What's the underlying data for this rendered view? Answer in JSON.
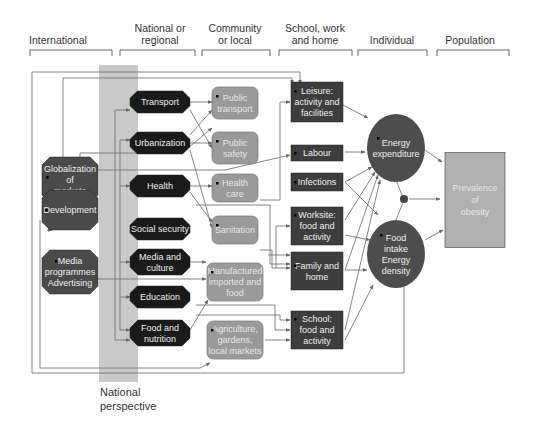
{
  "headers": [
    {
      "lines": [
        "International"
      ],
      "x": 58
    },
    {
      "lines": [
        "National or",
        "regional"
      ],
      "x": 160
    },
    {
      "lines": [
        "Community",
        "or local"
      ],
      "x": 235
    },
    {
      "lines": [
        "School, work",
        "and home"
      ],
      "x": 315
    },
    {
      "lines": [
        "Individual"
      ],
      "x": 392
    },
    {
      "lines": [
        "Population"
      ],
      "x": 470
    }
  ],
  "international": [
    {
      "id": "globalization",
      "lines": [
        "Globalization",
        "of",
        "markets"
      ]
    },
    {
      "id": "development",
      "lines": [
        "Development"
      ]
    },
    {
      "id": "media-advertising",
      "lines": [
        "Media",
        "programmes",
        "Advertising"
      ]
    }
  ],
  "national": [
    {
      "id": "transport",
      "lines": [
        "Transport"
      ]
    },
    {
      "id": "urbanization",
      "lines": [
        "Urbanization"
      ]
    },
    {
      "id": "health",
      "lines": [
        "Health"
      ]
    },
    {
      "id": "social-security",
      "lines": [
        "Social security"
      ]
    },
    {
      "id": "media-culture",
      "lines": [
        "Media and",
        "culture"
      ]
    },
    {
      "id": "education",
      "lines": [
        "Education"
      ]
    },
    {
      "id": "food-nutrition",
      "lines": [
        "Food and",
        "nutrition"
      ]
    }
  ],
  "community": [
    {
      "id": "public-transport",
      "lines": [
        "Public",
        "transport"
      ]
    },
    {
      "id": "public-safety",
      "lines": [
        "Public",
        "safety"
      ]
    },
    {
      "id": "health-care",
      "lines": [
        "Health",
        "care"
      ]
    },
    {
      "id": "sanitation",
      "lines": [
        "Sanitation"
      ]
    },
    {
      "id": "manufactured-food",
      "lines": [
        "Manufactured",
        "imported and",
        "food"
      ]
    },
    {
      "id": "agriculture",
      "lines": [
        "Agriculture,",
        "gardens,",
        "local markets"
      ]
    }
  ],
  "setting": [
    {
      "id": "leisure",
      "lines": [
        "Leisure:",
        "activity and",
        "facilities"
      ]
    },
    {
      "id": "labour",
      "lines": [
        "Labour"
      ]
    },
    {
      "id": "infections",
      "lines": [
        "Infections"
      ]
    },
    {
      "id": "worksite",
      "lines": [
        "Worksite:",
        "food and",
        "activity"
      ]
    },
    {
      "id": "family-home",
      "lines": [
        "Family and",
        "home"
      ]
    },
    {
      "id": "school",
      "lines": [
        "School:",
        "food and",
        "activity"
      ]
    }
  ],
  "individual": [
    {
      "id": "energy-expenditure",
      "lines": [
        "Energy",
        "expenditure"
      ]
    },
    {
      "id": "food-intake",
      "lines": [
        "Food",
        "intake",
        "Energy",
        "density"
      ]
    }
  ],
  "population": {
    "id": "prevalence-obesity",
    "lines": [
      "Prevalence",
      "of",
      "obesity"
    ]
  },
  "national_perspective": {
    "lines": [
      "National",
      "perspective"
    ]
  },
  "colors": {
    "octagon_dark": "#1a1a1a",
    "octagon_mid": "#4a4a4a",
    "community_box": "#9a9a9a",
    "setting_box": "#3d3d3d",
    "individual_ellipse": "#4d4d4d",
    "population_box": "#b0b0b0",
    "national_band": "#c8c8c8",
    "wire": "#777777"
  }
}
